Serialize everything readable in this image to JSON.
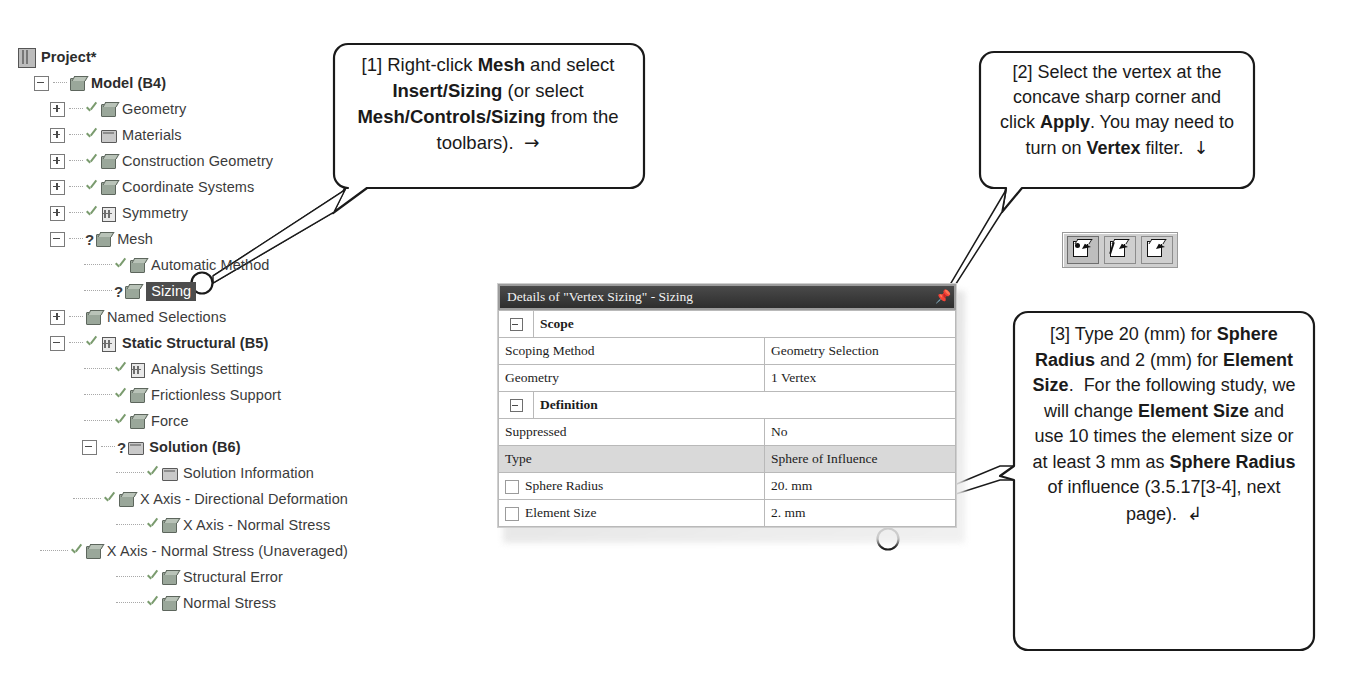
{
  "tree": {
    "name": "ansys-outline-tree",
    "items": [
      {
        "label": "Project*",
        "bold": true,
        "indent": 0,
        "expander": "none",
        "status": "none",
        "icon": "project-book-icon",
        "selected": false
      },
      {
        "label": "Model (B4)",
        "bold": true,
        "indent": 1,
        "expander": "minus",
        "status": "none",
        "icon": "model-icon",
        "selected": false
      },
      {
        "label": "Geometry",
        "bold": false,
        "indent": 2,
        "expander": "plus",
        "status": "check",
        "icon": "geometry-cube-icon",
        "selected": false
      },
      {
        "label": "Materials",
        "bold": false,
        "indent": 2,
        "expander": "plus",
        "status": "check",
        "icon": "materials-icon",
        "selected": false
      },
      {
        "label": "Construction Geometry",
        "bold": false,
        "indent": 2,
        "expander": "plus",
        "status": "check",
        "icon": "construction-geometry-icon",
        "selected": false
      },
      {
        "label": "Coordinate Systems",
        "bold": false,
        "indent": 2,
        "expander": "plus",
        "status": "check",
        "icon": "coordinate-systems-icon",
        "selected": false
      },
      {
        "label": "Symmetry",
        "bold": false,
        "indent": 2,
        "expander": "plus",
        "status": "check",
        "icon": "symmetry-icon",
        "selected": false
      },
      {
        "label": "Mesh",
        "bold": false,
        "indent": 2,
        "expander": "minus",
        "status": "question",
        "icon": "mesh-icon",
        "selected": false
      },
      {
        "label": "Automatic Method",
        "bold": false,
        "indent": 4,
        "expander": "none",
        "status": "check",
        "icon": "method-icon",
        "selected": false
      },
      {
        "label": "Sizing",
        "bold": false,
        "indent": 4,
        "expander": "none",
        "status": "question",
        "icon": "sizing-icon",
        "selected": true
      },
      {
        "label": "Named Selections",
        "bold": false,
        "indent": 2,
        "expander": "plus",
        "status": "none",
        "icon": "named-selections-icon",
        "selected": false
      },
      {
        "label": "Static Structural (B5)",
        "bold": true,
        "indent": 2,
        "expander": "minus",
        "status": "check",
        "icon": "static-structural-icon",
        "selected": false
      },
      {
        "label": "Analysis Settings",
        "bold": false,
        "indent": 4,
        "expander": "none",
        "status": "check",
        "icon": "analysis-settings-icon",
        "selected": false
      },
      {
        "label": "Frictionless Support",
        "bold": false,
        "indent": 4,
        "expander": "none",
        "status": "check",
        "icon": "frictionless-support-icon",
        "selected": false
      },
      {
        "label": "Force",
        "bold": false,
        "indent": 4,
        "expander": "none",
        "status": "check",
        "icon": "force-icon",
        "selected": false
      },
      {
        "label": "Solution (B6)",
        "bold": true,
        "indent": 4,
        "expander": "minus",
        "status": "question",
        "icon": "solution-folder-icon",
        "selected": false
      },
      {
        "label": "Solution Information",
        "bold": false,
        "indent": 6,
        "expander": "none",
        "status": "check",
        "icon": "solution-information-icon",
        "selected": false
      },
      {
        "label": "X Axis - Directional Deformation",
        "bold": false,
        "indent": 6,
        "expander": "none",
        "status": "check",
        "icon": "result-cube-icon",
        "selected": false
      },
      {
        "label": "X Axis - Normal Stress",
        "bold": false,
        "indent": 6,
        "expander": "none",
        "status": "check",
        "icon": "result-cube-icon",
        "selected": false
      },
      {
        "label": "X Axis - Normal Stress (Unaveraged)",
        "bold": false,
        "indent": 6,
        "expander": "none",
        "status": "check",
        "icon": "result-cube-icon",
        "selected": false
      },
      {
        "label": "Structural Error",
        "bold": false,
        "indent": 6,
        "expander": "none",
        "status": "check",
        "icon": "result-cube-icon",
        "selected": false
      },
      {
        "label": "Normal Stress",
        "bold": false,
        "indent": 6,
        "expander": "none",
        "status": "check",
        "icon": "result-cube-icon",
        "selected": false
      }
    ]
  },
  "details_panel": {
    "title": "Details of \"Vertex Sizing\" - Sizing",
    "pin_icon": "pin-icon",
    "rows": [
      {
        "kind": "group",
        "label": "Scope",
        "value": "",
        "expander": "minus",
        "highlight": false,
        "checkbox": false
      },
      {
        "kind": "field",
        "label": "Scoping Method",
        "value": "Geometry Selection",
        "expander": "none",
        "highlight": false,
        "checkbox": false
      },
      {
        "kind": "field",
        "label": "Geometry",
        "value": "1 Vertex",
        "expander": "none",
        "highlight": false,
        "checkbox": false
      },
      {
        "kind": "group",
        "label": "Definition",
        "value": "",
        "expander": "minus",
        "highlight": false,
        "checkbox": false
      },
      {
        "kind": "field",
        "label": "Suppressed",
        "value": "No",
        "expander": "none",
        "highlight": false,
        "checkbox": false
      },
      {
        "kind": "field",
        "label": "Type",
        "value": "Sphere of Influence",
        "expander": "none",
        "highlight": true,
        "checkbox": false
      },
      {
        "kind": "field",
        "label": "Sphere Radius",
        "value": "20. mm",
        "expander": "none",
        "highlight": false,
        "checkbox": true
      },
      {
        "kind": "field",
        "label": "Element Size",
        "value": "2. mm",
        "expander": "none",
        "highlight": false,
        "checkbox": true
      }
    ]
  },
  "toolbar": {
    "name": "selection-filter-toolbar",
    "buttons": [
      {
        "icon": "vertex-filter-icon",
        "active": true
      },
      {
        "icon": "edge-filter-icon",
        "active": false
      },
      {
        "icon": "face-filter-icon",
        "active": false
      }
    ]
  },
  "callouts": [
    {
      "id": "callout-1",
      "number": "[1]",
      "html": "[1] Right-click <b>Mesh</b> and select <b>Insert/Sizing</b> (or select <b>Mesh/Controls/Sizing</b> from the toolbars). &nbsp;<span class=\"arrowglyph\">&#8594;</span>",
      "plain": "[1] Right-click Mesh and select Insert/Sizing (or select Mesh/Controls/Sizing from the toolbars). →"
    },
    {
      "id": "callout-2",
      "number": "[2]",
      "html": "[2] Select the vertex at the concave sharp corner and click <b>Apply</b>. You may need to turn on <b>Vertex</b> filter. &nbsp;<span class=\"arrowglyph\">&#8595;</span>",
      "plain": "[2] Select the vertex at the concave sharp corner and click Apply. You may need to turn on Vertex filter. ↓"
    },
    {
      "id": "callout-3",
      "number": "[3]",
      "html": "[3] Type 20 (mm) for <b>Sphere Radius</b> and 2 (mm) for <b>Element Size</b>. &nbsp;For the following study, we will change <b>Element Size</b> and use 10 times the element size or at least 3 mm as <b>Sphere Radius</b> of influence (3.5.17[3-4], next page). &nbsp;<span class=\"arrowglyph\">&#8626;</span>",
      "plain": "[3] Type 20 (mm) for Sphere Radius and 2 (mm) for Element Size. For the following study, we will change Element Size and use 10 times the element size or at least 3 mm as Sphere Radius of influence (3.5.17[3-4], next page). ↲"
    }
  ],
  "markers": [
    {
      "name": "marker-circle-mesh",
      "x": 202,
      "y": 283,
      "r": 11
    },
    {
      "name": "marker-circle-geometry-row",
      "x": 878,
      "y": 393,
      "r": 11
    },
    {
      "name": "marker-circle-sphere-radius",
      "x": 890,
      "y": 508,
      "r": 11
    },
    {
      "name": "marker-circle-element-size",
      "x": 890,
      "y": 538,
      "r": 11
    }
  ],
  "colors": {
    "background": "#ffffff",
    "text": "#1a1a1a",
    "tree_text": "#3b3b3b",
    "selection": "#4d4d4d",
    "panel_title_bg": "#3a3a3a",
    "panel_border": "#b9b9b9",
    "row_highlight": "#d9d9d9",
    "toolbar_bg": "#cfcfcf",
    "line": "#3a3a3a"
  }
}
